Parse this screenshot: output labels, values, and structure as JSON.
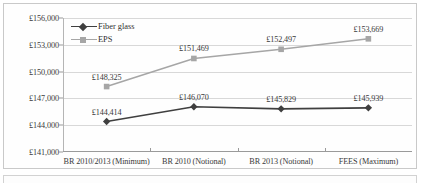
{
  "chart_data": {
    "type": "line",
    "title": "",
    "subtitle": "",
    "xlabel": "",
    "ylabel": "",
    "categories": [
      "BR 2010/2013 (Minimum)",
      "BR 2010 (Notional)",
      "BR 2013 (Notional)",
      "FEES (Maximum)"
    ],
    "ylim": [
      141000,
      156000
    ],
    "yticks": [
      141000,
      144000,
      147000,
      150000,
      153000,
      156000
    ],
    "ytick_labels": [
      "£141,000",
      "£144,000",
      "£147,000",
      "£150,000",
      "£153,000",
      "£156,000"
    ],
    "grid": true,
    "legend_position": "top-left-inside",
    "series": [
      {
        "name": "Fiber glass",
        "color": "#3f3f3f",
        "marker": "diamond",
        "values": [
          144414,
          146070,
          145829,
          145939
        ],
        "data_labels": [
          "£144,414",
          "£146,070",
          "£145,829",
          "£145,939"
        ]
      },
      {
        "name": "EPS",
        "color": "#a6a6a6",
        "marker": "square",
        "values": [
          148325,
          151469,
          152497,
          153669
        ],
        "data_labels": [
          "£148,325",
          "£151,469",
          "£152,497",
          "£153,669"
        ]
      }
    ]
  }
}
